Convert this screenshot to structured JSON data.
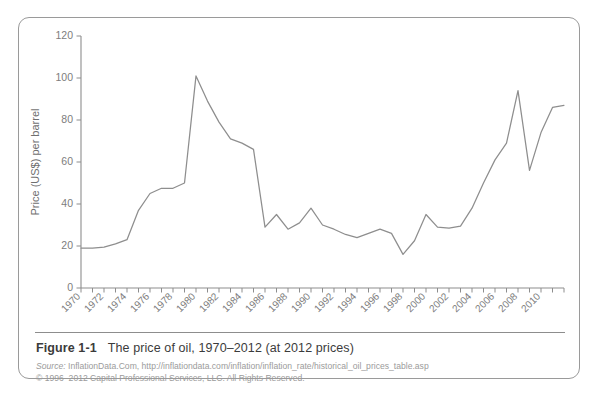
{
  "figure": {
    "label": "Figure 1-1",
    "caption": "The price of oil, 1970–2012 (at 2012 prices)",
    "source_prefix": "Source:",
    "source_line1": " InflationData.Com, http://inflationdata.com/inflation/inflation_rate/historical_oil_prices_table.asp",
    "source_line2": "© 1996–2012 Capital Professional Services, LLC. All Rights Reserved."
  },
  "chart_data": {
    "type": "line",
    "title": "The price of oil, 1970–2012 (at 2012 prices)",
    "xlabel": "",
    "ylabel": "Price (US$) per barrel",
    "xlim": [
      1970,
      2012
    ],
    "ylim": [
      0,
      120
    ],
    "grid": false,
    "legend": null,
    "ytick_labels": [
      "0",
      "20",
      "40",
      "60",
      "80",
      "100",
      "120"
    ],
    "yticks": [
      0,
      20,
      40,
      60,
      80,
      100,
      120
    ],
    "xtick_labels": [
      "1970",
      "1972",
      "1974",
      "1976",
      "1978",
      "1980",
      "1982",
      "1984",
      "1986",
      "1988",
      "1990",
      "1992",
      "1994",
      "1996",
      "1998",
      "2000",
      "2002",
      "2004",
      "2006",
      "2008",
      "2010"
    ],
    "xticks": [
      1970,
      1972,
      1974,
      1976,
      1978,
      1980,
      1982,
      1984,
      1986,
      1988,
      1990,
      1992,
      1994,
      1996,
      1998,
      2000,
      2002,
      2004,
      2006,
      2008,
      2010
    ],
    "minor_xticks_every": 1,
    "series": [
      {
        "name": "Crude oil price (2012 US$ per barrel)",
        "color": "#8e8e8e",
        "x": [
          1970,
          1971,
          1972,
          1973,
          1974,
          1975,
          1976,
          1977,
          1978,
          1979,
          1980,
          1981,
          1982,
          1983,
          1984,
          1985,
          1986,
          1987,
          1988,
          1989,
          1990,
          1991,
          1992,
          1993,
          1994,
          1995,
          1996,
          1997,
          1998,
          1999,
          2000,
          2001,
          2002,
          2003,
          2004,
          2005,
          2006,
          2007,
          2008,
          2009,
          2010,
          2011,
          2012
        ],
        "values": [
          19,
          19,
          19.5,
          21,
          23,
          37,
          45,
          47.5,
          47.5,
          50,
          101,
          89,
          79,
          71,
          69,
          66,
          29,
          35,
          28,
          31,
          38,
          30,
          28,
          25.5,
          24,
          26,
          28,
          26,
          16,
          22.5,
          35,
          29,
          28.5,
          29.5,
          38,
          50,
          61,
          69,
          94,
          56,
          74,
          86,
          87
        ]
      }
    ]
  }
}
